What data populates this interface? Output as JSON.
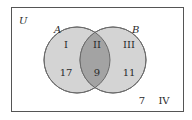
{
  "diagram": {
    "universe_label": "U",
    "set_a_label": "A",
    "set_b_label": "B",
    "regions": [
      {
        "roman": "I",
        "count": "17"
      },
      {
        "roman": "II",
        "count": "9"
      },
      {
        "roman": "III",
        "count": "11"
      },
      {
        "roman": "IV",
        "count": "7"
      }
    ],
    "colors": {
      "circle_fill": "#d4d4d4",
      "intersection_fill": "#a3a3a3",
      "stroke": "#6a6a6a",
      "frame": "#555555"
    }
  }
}
